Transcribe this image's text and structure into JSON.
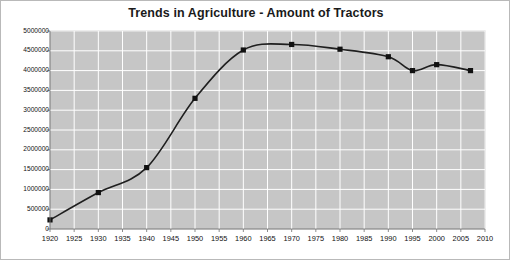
{
  "chart_data": {
    "type": "line",
    "title": "Trends in Agriculture - Amount of Tractors",
    "xlabel": "",
    "ylabel": "",
    "xlim": [
      1920,
      2010
    ],
    "ylim": [
      0,
      5000000
    ],
    "grid": true,
    "legend": "none",
    "plot_background": "#c6c6c6",
    "line_color": "#1a1a1a",
    "marker_color": "#111111",
    "marker_shape": "square",
    "x_ticks": [
      1920,
      1925,
      1930,
      1935,
      1940,
      1945,
      1950,
      1955,
      1960,
      1965,
      1970,
      1975,
      1980,
      1985,
      1990,
      1995,
      2000,
      2005,
      2010
    ],
    "y_ticks": [
      0,
      500000,
      1000000,
      1500000,
      2000000,
      2500000,
      3000000,
      3500000,
      4000000,
      4500000,
      5000000
    ],
    "y_tick_labels": [
      "0",
      "500000",
      "1000000",
      "1500000",
      "2000000",
      "2500000",
      "3000000",
      "3500000",
      "4000000",
      "4500000",
      "5000000"
    ],
    "x": [
      1920,
      1930,
      1940,
      1950,
      1960,
      1970,
      1980,
      1990,
      1995,
      2000,
      2007
    ],
    "values": [
      230000,
      920000,
      1550000,
      3300000,
      4520000,
      4660000,
      4540000,
      4350000,
      4000000,
      4150000,
      4000000
    ]
  }
}
